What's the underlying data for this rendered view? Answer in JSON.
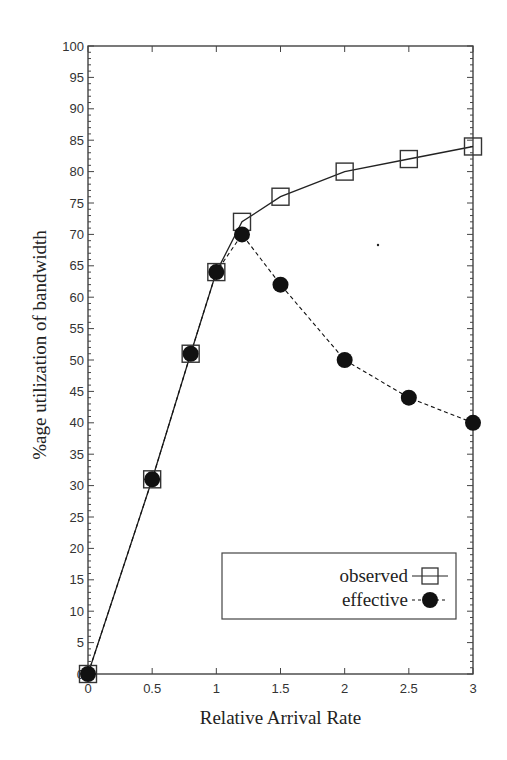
{
  "chart_data": {
    "type": "line",
    "title": "",
    "xlabel": "Relative Arrival Rate",
    "ylabel": "%age utilization of bandwidth",
    "xlim": [
      0,
      3
    ],
    "ylim": [
      0,
      100
    ],
    "xticks": [
      0,
      0.5,
      1,
      1.5,
      2,
      2.5,
      3
    ],
    "xtick_labels": [
      "0",
      "0.5",
      "1",
      "1.5",
      "2",
      "2.5",
      "3"
    ],
    "yticks": [
      0,
      5,
      10,
      15,
      20,
      25,
      30,
      35,
      40,
      45,
      50,
      55,
      60,
      65,
      70,
      75,
      80,
      85,
      90,
      95,
      100
    ],
    "ytick_labels": [
      "0",
      "5",
      "10",
      "15",
      "20",
      "25",
      "30",
      "35",
      "40",
      "45",
      "50",
      "55",
      "60",
      "65",
      "70",
      "75",
      "80",
      "85",
      "90",
      "95",
      "100"
    ],
    "grid": false,
    "legend_position": "bottom-right",
    "series": [
      {
        "name": "observed",
        "marker": "open-square",
        "line_style": "solid",
        "color": "#222222",
        "x": [
          0,
          0.5,
          0.8,
          1,
          1.2,
          1.5,
          2,
          2.5,
          3
        ],
        "y": [
          0,
          31,
          51,
          64,
          72,
          76,
          80,
          82,
          84
        ]
      },
      {
        "name": "effective",
        "marker": "filled-circle",
        "line_style": "dashed",
        "color": "#111111",
        "x": [
          0,
          0.5,
          0.8,
          1,
          1.2,
          1.5,
          2,
          2.5,
          3
        ],
        "y": [
          0,
          31,
          51,
          64,
          70,
          62,
          50,
          44,
          40
        ]
      }
    ]
  }
}
